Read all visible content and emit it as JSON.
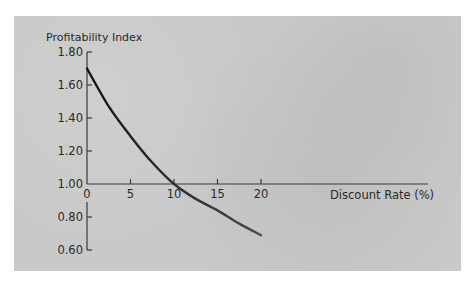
{
  "chart_data": {
    "type": "line",
    "title": "",
    "ylabel": "Profitability Index",
    "xlabel": "Discount Rate (%)",
    "x": [
      0,
      2.5,
      5,
      7.5,
      10,
      12.5,
      15,
      17.5,
      20
    ],
    "series": [
      {
        "name": "Profitability Index",
        "values": [
          1.7,
          1.47,
          1.29,
          1.13,
          1.0,
          0.91,
          0.84,
          0.76,
          0.69
        ]
      }
    ],
    "xticks": [
      "0",
      "5",
      "10",
      "15",
      "20"
    ],
    "yticks": [
      "1.80",
      "1.60",
      "1.40",
      "1.20",
      "1.00",
      "0.80",
      "0.60"
    ],
    "xlim": [
      0,
      20
    ],
    "ylim": [
      0.6,
      1.8
    ],
    "x_axis_crosses_y_at": 1.0,
    "grid": false,
    "legend": "none"
  },
  "colors": {
    "panel_background": "#c9c9c9",
    "page_background": "#ffffff",
    "axis": "#3a3a3a",
    "curve_start": "#111111",
    "curve_end": "#4a4a4a",
    "text": "#2a2a2a"
  }
}
